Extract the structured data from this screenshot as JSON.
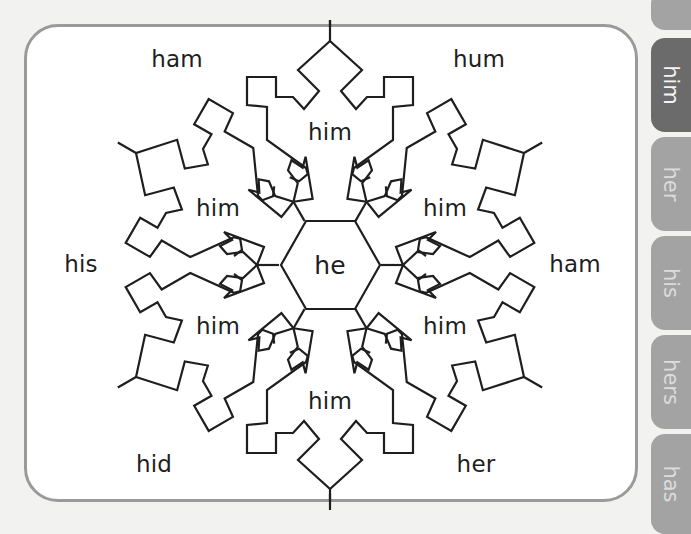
{
  "worksheet": {
    "center_word": "he",
    "inner_words": [
      "him",
      "him",
      "him",
      "him",
      "him",
      "him"
    ],
    "outer_words": {
      "top_left": "ham",
      "top_right": "hum",
      "left": "his",
      "right": "ham",
      "bottom_left": "hid",
      "bottom_right": "her"
    }
  },
  "tabs": [
    {
      "label": "",
      "active": false
    },
    {
      "label": "him",
      "active": true
    },
    {
      "label": "her",
      "active": false
    },
    {
      "label": "his",
      "active": false
    },
    {
      "label": "hers",
      "active": false
    },
    {
      "label": "has",
      "active": false
    }
  ],
  "colors": {
    "active_tab": "#6b6b6b",
    "inactive_tab": "#a3a3a3",
    "border": "#9a9a9a",
    "line": "#1e1e1e"
  }
}
